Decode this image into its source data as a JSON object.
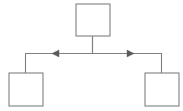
{
  "diagram": {
    "title": "",
    "background_color": "#ffffff",
    "stroke_color": "#808080",
    "arrow_color": "#5a5a5a",
    "node_fill_color": "#ffffff",
    "nodes": [
      {
        "id": "top",
        "label": "",
        "x": 76,
        "y": 4,
        "width": 34,
        "height": 32
      },
      {
        "id": "left",
        "label": "",
        "x": 9,
        "y": 73,
        "width": 34,
        "height": 33
      },
      {
        "id": "right",
        "label": "",
        "x": 145,
        "y": 73,
        "width": 34,
        "height": 33
      }
    ],
    "edges": [
      {
        "id": "top-to-left",
        "from": "top",
        "to": "left",
        "label": "",
        "arrow": "left",
        "path": "M 92.5 36 L 92.5 53.5 L 25.5 53.5 L 25.5 73",
        "arrow_points": "52,53.5 59,50 59,57"
      },
      {
        "id": "top-to-right",
        "from": "top",
        "to": "right",
        "label": "",
        "arrow": "right",
        "path": "M 92.5 36 L 92.5 53.5 L 161.5 53.5 L 161.5 73",
        "arrow_points": "134,53.5 127,50 127,57"
      }
    ]
  }
}
